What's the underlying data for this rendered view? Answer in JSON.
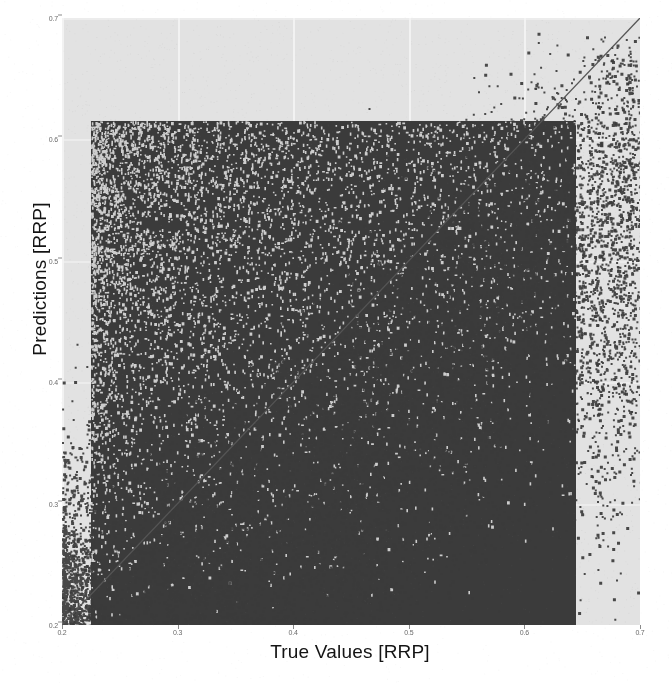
{
  "chart_data": {
    "type": "scatter",
    "title": "",
    "subtitle": "",
    "xlabel": "True Values [RRP]",
    "ylabel": "Predictions [RRP]",
    "xlim": [
      0.2,
      0.7
    ],
    "ylim": [
      0.2,
      0.7
    ],
    "xticks": [
      0.2,
      0.3,
      0.4,
      0.5,
      0.6,
      0.7
    ],
    "xticklabels": [
      "0.2",
      "0.3",
      "0.4",
      "0.5",
      "0.6",
      "0.7"
    ],
    "yticks": [
      0.2,
      0.3,
      0.4,
      0.5,
      0.6,
      0.7
    ],
    "yticklabels": [
      "0.2",
      "0.3",
      "0.4",
      "0.5",
      "0.6",
      "0.7"
    ],
    "grid": true,
    "grid_color": "#f4f4f4",
    "background_color": "#e2e2e2",
    "marker_color": "#3b3b3b",
    "marker_size": 2,
    "legend": null,
    "legend_position": "none",
    "annotations": [
      {
        "type": "line",
        "name": "identity-line",
        "description": "y = x reference diagonal",
        "from": [
          0.2,
          0.2
        ],
        "to": [
          0.7,
          0.7
        ],
        "color": "#555555"
      }
    ],
    "series": [
      {
        "name": "predictions-vs-true",
        "marker": "square",
        "color": "#3b3b3b",
        "point_count_approx": 40000,
        "description": "Dense overplotted cloud saturating a rectangular core spanning true values 0.22-0.65 and predictions 0.20-0.62, with sparse vertically-striped tails extending left and downward; density increases toward the lower-right of the core.",
        "density_core": {
          "x": [
            0.225,
            0.645
          ],
          "y": [
            0.2,
            0.615
          ]
        },
        "sparse_tail_x": [
          0.2,
          0.3
        ],
        "sparse_tail_y": [
          0.2,
          0.62
        ]
      }
    ]
  },
  "axes": {
    "x_label": "True Values [RRP]",
    "y_label": "Predictions [RRP]"
  }
}
